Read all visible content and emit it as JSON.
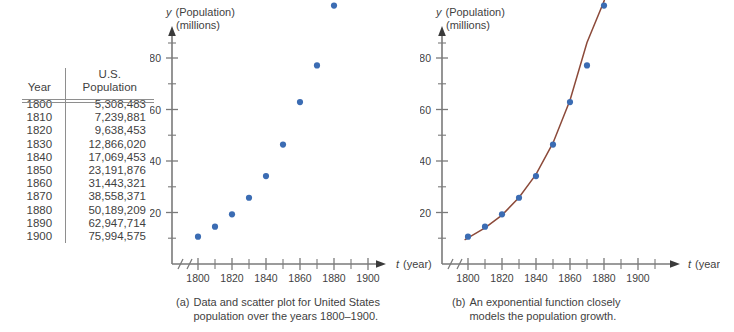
{
  "table": {
    "headers": [
      "Year",
      "U.S.\nPopulation"
    ],
    "header_year": "Year",
    "header_pop_line1": "U.S.",
    "header_pop_line2": "Population",
    "rows": [
      {
        "year": "1800",
        "population": "5,308,483"
      },
      {
        "year": "1810",
        "population": "7,239,881"
      },
      {
        "year": "1820",
        "population": "9,638,453"
      },
      {
        "year": "1830",
        "population": "12,866,020"
      },
      {
        "year": "1840",
        "population": "17,069,453"
      },
      {
        "year": "1850",
        "population": "23,191,876"
      },
      {
        "year": "1860",
        "population": "31,443,321"
      },
      {
        "year": "1870",
        "population": "38,558,371"
      },
      {
        "year": "1880",
        "population": "50,189,209"
      },
      {
        "year": "1890",
        "population": "62,947,714"
      },
      {
        "year": "1900",
        "population": "75,994,575"
      }
    ]
  },
  "captions": {
    "a_tag": "(a)",
    "a_line1": "Data and scatter plot for United States",
    "a_line2": "population over the years 1800–1900.",
    "b_tag": "(b)",
    "b_line1": "An exponential function closely",
    "b_line2": "models the population growth."
  },
  "axis": {
    "y_label_line1_var": "y",
    "y_label_line1_rest": "(Population)",
    "y_label_line2": "(millions)",
    "x_label_var": "t",
    "x_label_rest": "(year)",
    "y_ticks": [
      "20",
      "40",
      "60",
      "80"
    ],
    "x_ticks": [
      "1800",
      "1820",
      "1840",
      "1860",
      "1880",
      "1900"
    ]
  },
  "colors": {
    "point": "#3B6CB3",
    "curve": "#8C4A3A",
    "axis": "#7a7a7a",
    "text": "#3f3f3f",
    "rule": "#8e8e8e",
    "background": "#ffffff"
  },
  "chart_data": [
    {
      "type": "scatter",
      "id": "scatter-plot",
      "title": "",
      "xlabel": "t (year)",
      "ylabel": "y (Population) (millions)",
      "xlim": [
        1795,
        1915
      ],
      "ylim": [
        0,
        85
      ],
      "xticks_major": [
        1800,
        1820,
        1840,
        1860,
        1880,
        1900
      ],
      "xticks_minor_step": 10,
      "yticks_major": [
        20,
        40,
        60,
        80
      ],
      "yticks_minor_step": 10,
      "grid": false,
      "legend": "none",
      "axis_break": true,
      "x": [
        1800,
        1810,
        1820,
        1830,
        1840,
        1850,
        1860,
        1870,
        1880,
        1890,
        1900
      ],
      "y": [
        5.308483,
        7.239881,
        9.638453,
        12.86602,
        17.069453,
        23.191876,
        31.443321,
        38.558371,
        50.189209,
        62.947714,
        75.994575
      ]
    },
    {
      "type": "scatter",
      "id": "scatter-with-exponential-fit",
      "title": "",
      "xlabel": "t (year)",
      "ylabel": "y (Population) (millions)",
      "xlim": [
        1795,
        1915
      ],
      "ylim": [
        0,
        85
      ],
      "xticks_major": [
        1800,
        1820,
        1840,
        1860,
        1880,
        1900
      ],
      "xticks_minor_step": 10,
      "yticks_major": [
        20,
        40,
        60,
        80
      ],
      "yticks_minor_step": 10,
      "grid": false,
      "legend": "none",
      "axis_break": true,
      "x": [
        1800,
        1810,
        1820,
        1830,
        1840,
        1850,
        1860,
        1870,
        1880,
        1890,
        1900
      ],
      "y": [
        5.308483,
        7.239881,
        9.638453,
        12.86602,
        17.069453,
        23.191876,
        31.443321,
        38.558371,
        50.189209,
        62.947714,
        75.994575
      ],
      "series": [
        {
          "name": "exponential model",
          "type": "line",
          "color": "#8C4A3A",
          "curve_x": [
            1798,
            1810,
            1820,
            1830,
            1840,
            1850,
            1860,
            1870,
            1880,
            1890,
            1900,
            1904
          ],
          "curve_y": [
            4.7,
            7.0,
            9.5,
            12.9,
            17.4,
            23.5,
            31.8,
            43.0,
            51.0,
            62.5,
            76.0,
            84.0
          ]
        }
      ]
    }
  ]
}
